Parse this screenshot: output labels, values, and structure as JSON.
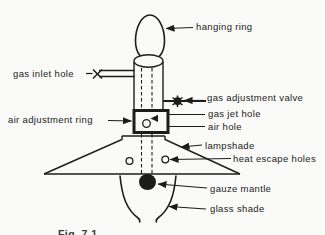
{
  "figure": {
    "type": "labelled-diagram",
    "labels": {
      "hanging_ring": "hanging ring",
      "gas_inlet_hole": "gas inlet hole",
      "gas_adjustment_valve": "gas adjustment valve",
      "gas_jet_hole": "gas jet hole",
      "air_hole": "air hole",
      "air_adjustment_ring": "air adjustment ring",
      "lampshade": "lampshade",
      "heat_escape_holes": "heat escape holes",
      "gauze_mantle": "gauze mantle",
      "glass_shade": "glass shade"
    },
    "caption_partial": "Fig. 7.1",
    "colors": {
      "ink": "#1c1c1c",
      "background": "#fafaf8"
    }
  }
}
